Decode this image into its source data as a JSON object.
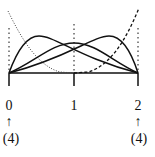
{
  "diagram": {
    "type": "b-spline-basis-functions",
    "knots": [
      {
        "label": "0",
        "multiplicity_label": "(4)",
        "has_arrow": true
      },
      {
        "label": "1",
        "multiplicity_label": "",
        "has_arrow": false
      },
      {
        "label": "2",
        "multiplicity_label": "(4)",
        "has_arrow": true
      }
    ],
    "curves": [
      {
        "name": "dotted-decreasing-basis",
        "style": "dotted"
      },
      {
        "name": "solid-left-basis",
        "style": "solid"
      },
      {
        "name": "solid-middle-basis",
        "style": "solid"
      },
      {
        "name": "solid-right-basis",
        "style": "solid"
      },
      {
        "name": "dashed-increasing-basis",
        "style": "dashed"
      }
    ],
    "arrow_glyph": "↑",
    "colors": {
      "line": "#111111",
      "background": "#ffffff"
    }
  }
}
